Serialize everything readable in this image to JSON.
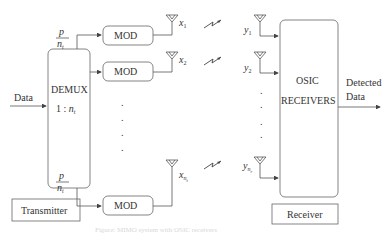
{
  "diagram": {
    "transmitter": {
      "input_label": "Data",
      "demux": {
        "label": "DEMUX",
        "ratio_prefix": "1 : ",
        "ratio_var": "n",
        "ratio_sub": "t"
      },
      "rate_fraction": {
        "numerator": "p",
        "denominator": "n",
        "denominator_sub": "t"
      },
      "modulators": [
        {
          "label": "MOD",
          "antenna_symbol": "x",
          "antenna_sub": "1"
        },
        {
          "label": "MOD",
          "antenna_symbol": "x",
          "antenna_sub": "2"
        },
        {
          "label": "MOD",
          "antenna_symbol": "x",
          "antenna_sub": "n",
          "antenna_subsub": "t"
        }
      ],
      "ellipsis": ".",
      "section_label": "Transmitter"
    },
    "channel": {
      "links": 3,
      "icon": "wireless-link-icon"
    },
    "receiver": {
      "antennas": [
        {
          "symbol": "y",
          "sub": "1"
        },
        {
          "symbol": "y",
          "sub": "2"
        },
        {
          "symbol": "y",
          "sub": "n",
          "subsub": "r"
        }
      ],
      "block": {
        "line1": "OSIC",
        "line2": "RECEIVERS"
      },
      "output_label": {
        "line1": "Detected",
        "line2": "Data"
      },
      "section_label": "Receiver"
    },
    "caption": "Figure: MIMO system with OSIC receivers"
  },
  "colors": {
    "stroke": "#555555",
    "text": "#333333",
    "background": "#ffffff"
  }
}
